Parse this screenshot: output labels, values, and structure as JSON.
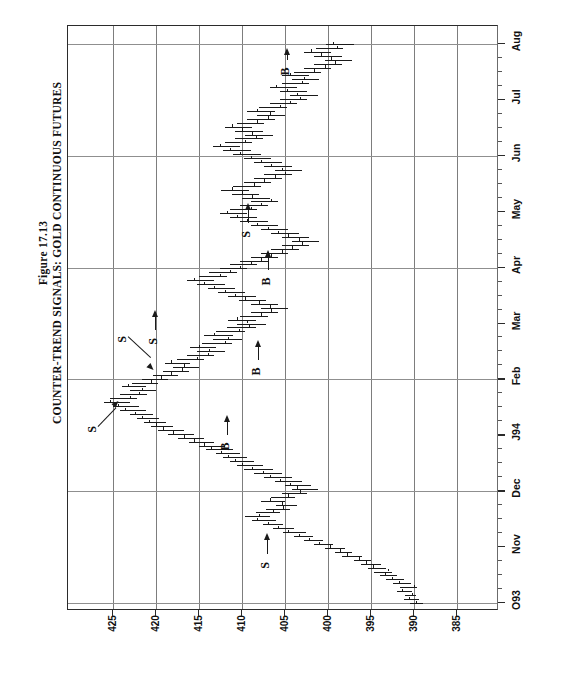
{
  "figure": {
    "number_label": "Figure 17.13",
    "title": "COUNTER-TREND SIGNALS: GOLD CONTINUOUS FUTURES",
    "note_prefix": "Note:",
    "note": " Percentages are calculated as price changes in continuous futures divided by corresponding nearest futures price levels. B = buy signal: 4% decline from prior high; S = sell signal: 4% advance from prior low."
  },
  "chart_data": {
    "type": "bar",
    "title": "COUNTER-TREND SIGNALS: GOLD CONTINUOUS FUTURES",
    "subtitle": "Figure 17.13",
    "xlabel": "",
    "ylabel": "",
    "orientation": "rotated-90",
    "grid": true,
    "legend_position": "none",
    "price_axis": {
      "tick_labels": [
        "425",
        "420",
        "415",
        "410",
        "405",
        "400",
        "395",
        "390",
        "385"
      ],
      "values": [
        425,
        420,
        415,
        410,
        405,
        400,
        395,
        390,
        385
      ],
      "range": [
        383,
        427.5
      ],
      "direction": "descending-left-to-right"
    },
    "time_axis": {
      "tick_labels": [
        "O93",
        "Nov",
        "Dec",
        "J94",
        "Feb",
        "Mar",
        "Apr",
        "May",
        "Jun",
        "Jul",
        "Aug"
      ],
      "direction": "bottom-to-top"
    },
    "series_name": "Gold Continuous Futures daily high-low-close bars",
    "bars": [
      [
        390.5,
        389.0,
        389.8
      ],
      [
        391.2,
        389.4,
        390.6
      ],
      [
        391.0,
        389.8,
        390.2
      ],
      [
        392.0,
        390.2,
        391.4
      ],
      [
        391.6,
        389.6,
        390.0
      ],
      [
        392.4,
        390.4,
        391.8
      ],
      [
        393.2,
        391.2,
        392.6
      ],
      [
        394.0,
        392.0,
        393.4
      ],
      [
        394.6,
        392.6,
        393.0
      ],
      [
        395.4,
        393.2,
        394.8
      ],
      [
        396.2,
        393.8,
        395.6
      ],
      [
        397.0,
        395.0,
        396.4
      ],
      [
        398.4,
        396.0,
        397.8
      ],
      [
        399.2,
        397.2,
        398.6
      ],
      [
        400.4,
        398.0,
        399.8
      ],
      [
        401.6,
        399.4,
        401.0
      ],
      [
        402.8,
        400.6,
        402.2
      ],
      [
        404.0,
        401.8,
        403.4
      ],
      [
        405.2,
        402.6,
        404.6
      ],
      [
        406.4,
        404.0,
        405.8
      ],
      [
        407.6,
        405.2,
        407.0
      ],
      [
        408.8,
        406.0,
        408.2
      ],
      [
        409.6,
        406.8,
        408.0
      ],
      [
        408.4,
        405.6,
        406.4
      ],
      [
        407.2,
        404.4,
        405.2
      ],
      [
        406.0,
        403.6,
        405.4
      ],
      [
        407.8,
        405.0,
        406.8
      ],
      [
        406.6,
        403.8,
        404.6
      ],
      [
        405.4,
        402.4,
        403.2
      ],
      [
        404.2,
        401.2,
        403.6
      ],
      [
        405.0,
        402.0,
        404.4
      ],
      [
        406.2,
        403.0,
        405.6
      ],
      [
        407.4,
        404.2,
        406.8
      ],
      [
        408.6,
        405.4,
        407.6
      ],
      [
        409.8,
        406.4,
        408.8
      ],
      [
        410.6,
        407.6,
        410.0
      ],
      [
        411.4,
        408.6,
        410.8
      ],
      [
        412.2,
        409.4,
        411.6
      ],
      [
        413.0,
        410.2,
        412.4
      ],
      [
        414.2,
        411.0,
        413.6
      ],
      [
        415.0,
        412.0,
        414.4
      ],
      [
        416.2,
        413.2,
        415.6
      ],
      [
        417.4,
        414.4,
        416.8
      ],
      [
        418.6,
        415.6,
        418.0
      ],
      [
        419.8,
        416.8,
        419.2
      ],
      [
        420.6,
        418.0,
        420.0
      ],
      [
        421.4,
        418.8,
        420.8
      ],
      [
        422.2,
        419.6,
        421.6
      ],
      [
        423.0,
        420.4,
        422.4
      ],
      [
        424.2,
        421.2,
        423.6
      ],
      [
        425.0,
        422.0,
        424.4
      ],
      [
        426.0,
        423.0,
        425.4
      ],
      [
        425.4,
        422.2,
        423.0
      ],
      [
        424.2,
        421.0,
        422.0
      ],
      [
        423.0,
        420.0,
        421.6
      ],
      [
        424.0,
        421.2,
        423.2
      ],
      [
        422.8,
        419.8,
        420.6
      ],
      [
        421.6,
        418.6,
        419.4
      ],
      [
        420.4,
        417.4,
        418.2
      ],
      [
        419.2,
        416.2,
        417.0
      ],
      [
        418.0,
        415.0,
        416.8
      ],
      [
        419.0,
        416.0,
        418.2
      ],
      [
        417.6,
        414.4,
        415.2
      ],
      [
        416.4,
        413.2,
        414.0
      ],
      [
        415.2,
        412.0,
        413.8
      ],
      [
        416.0,
        413.0,
        415.0
      ],
      [
        414.6,
        411.2,
        412.0
      ],
      [
        413.4,
        410.0,
        411.6
      ],
      [
        414.4,
        411.0,
        413.2
      ],
      [
        413.0,
        409.6,
        410.4
      ],
      [
        411.8,
        408.4,
        409.2
      ],
      [
        410.6,
        407.2,
        409.4
      ],
      [
        411.6,
        408.4,
        410.6
      ],
      [
        410.2,
        407.0,
        407.8
      ],
      [
        409.0,
        405.8,
        406.6
      ],
      [
        407.8,
        404.6,
        406.8
      ],
      [
        409.0,
        405.8,
        408.0
      ],
      [
        410.4,
        407.2,
        409.6
      ],
      [
        411.6,
        408.4,
        410.8
      ],
      [
        412.8,
        409.6,
        412.0
      ],
      [
        414.0,
        410.8,
        413.2
      ],
      [
        415.2,
        412.0,
        414.4
      ],
      [
        416.4,
        413.2,
        415.6
      ],
      [
        415.0,
        411.8,
        412.6
      ],
      [
        413.8,
        410.6,
        411.4
      ],
      [
        412.6,
        409.4,
        410.2
      ],
      [
        411.4,
        408.2,
        409.0
      ],
      [
        410.2,
        407.0,
        407.8
      ],
      [
        409.0,
        405.8,
        406.6
      ],
      [
        407.8,
        404.6,
        405.4
      ],
      [
        406.6,
        403.4,
        404.2
      ],
      [
        405.4,
        402.2,
        403.0
      ],
      [
        404.2,
        401.0,
        403.4
      ],
      [
        405.4,
        402.2,
        404.6
      ],
      [
        406.6,
        403.4,
        405.8
      ],
      [
        407.8,
        404.6,
        407.0
      ],
      [
        409.0,
        405.8,
        408.2
      ],
      [
        410.2,
        407.0,
        409.4
      ],
      [
        411.4,
        408.2,
        410.6
      ],
      [
        412.6,
        409.4,
        411.8
      ],
      [
        411.4,
        408.2,
        409.0
      ],
      [
        410.2,
        407.0,
        407.8
      ],
      [
        409.0,
        405.8,
        406.6
      ],
      [
        410.0,
        406.8,
        408.8
      ],
      [
        411.2,
        408.0,
        410.0
      ],
      [
        412.4,
        409.2,
        411.2
      ],
      [
        411.0,
        407.8,
        408.6
      ],
      [
        409.8,
        406.6,
        407.4
      ],
      [
        408.6,
        405.4,
        406.2
      ],
      [
        407.4,
        404.2,
        405.0
      ],
      [
        406.2,
        403.0,
        405.4
      ],
      [
        407.4,
        404.2,
        406.6
      ],
      [
        408.6,
        405.4,
        407.8
      ],
      [
        409.8,
        406.6,
        409.0
      ],
      [
        411.0,
        407.8,
        410.2
      ],
      [
        412.2,
        409.0,
        411.4
      ],
      [
        413.4,
        410.2,
        412.6
      ],
      [
        412.0,
        408.8,
        409.6
      ],
      [
        410.8,
        407.6,
        408.4
      ],
      [
        409.6,
        406.4,
        408.8
      ],
      [
        410.8,
        407.6,
        410.0
      ],
      [
        412.0,
        408.8,
        411.2
      ],
      [
        410.6,
        407.4,
        408.2
      ],
      [
        409.4,
        406.2,
        407.0
      ],
      [
        408.2,
        405.0,
        406.8
      ],
      [
        409.4,
        406.2,
        408.2
      ],
      [
        408.0,
        404.8,
        405.6
      ],
      [
        406.8,
        403.6,
        404.4
      ],
      [
        405.6,
        402.4,
        403.2
      ],
      [
        404.4,
        401.2,
        403.6
      ],
      [
        405.6,
        402.4,
        404.8
      ],
      [
        406.8,
        403.6,
        406.0
      ],
      [
        405.4,
        402.2,
        403.0
      ],
      [
        404.2,
        401.0,
        402.8
      ],
      [
        405.4,
        402.2,
        404.4
      ],
      [
        404.0,
        400.8,
        401.6
      ],
      [
        402.8,
        399.6,
        400.4
      ],
      [
        401.6,
        398.4,
        399.2
      ],
      [
        400.4,
        397.2,
        399.6
      ],
      [
        401.6,
        398.4,
        400.8
      ],
      [
        402.8,
        399.6,
        402.0
      ],
      [
        401.4,
        398.2,
        399.0
      ],
      [
        400.2,
        397.0,
        399.4
      ]
    ]
  },
  "signals": [
    {
      "type": "S",
      "label": "S",
      "month": "Nov",
      "kind": "sell"
    },
    {
      "type": "S",
      "label": "S",
      "month": "Dec",
      "kind": "sell"
    },
    {
      "type": "B",
      "label": "B",
      "month": "Dec",
      "kind": "buy"
    },
    {
      "type": "S",
      "label": "S",
      "month": "J94",
      "kind": "sell"
    },
    {
      "type": "B",
      "label": "B",
      "month": "Feb",
      "kind": "buy"
    },
    {
      "type": "S",
      "label": "S",
      "month": "Mar",
      "kind": "sell"
    },
    {
      "type": "B",
      "label": "B",
      "month": "Apr",
      "kind": "buy"
    },
    {
      "type": "S",
      "label": "S",
      "month": "May",
      "kind": "sell"
    },
    {
      "type": "B",
      "label": "B",
      "month": "Jul",
      "kind": "buy"
    }
  ]
}
